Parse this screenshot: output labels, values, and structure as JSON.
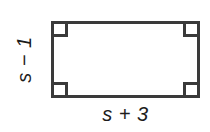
{
  "figure": {
    "type": "geometry-diagram",
    "shape": "rectangle",
    "background_color": "#ffffff",
    "stroke_color": "#3a3a3a",
    "text_color": "#1c1c1c",
    "labels": {
      "height_label": "s − 1",
      "width_label": "s + 3"
    },
    "right_angle_marks": {
      "top_left": "right-angle",
      "top_right": "right-angle",
      "bottom_left": "right-angle",
      "bottom_right": "right-angle"
    }
  }
}
